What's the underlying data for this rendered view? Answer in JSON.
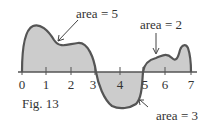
{
  "figure": {
    "caption": "Fig. 13",
    "x_ticks": [
      "0",
      "1",
      "2",
      "3",
      "4",
      "5",
      "6",
      "7"
    ],
    "annotations": [
      {
        "text": "area = 5",
        "region": "0 to 3, above axis"
      },
      {
        "text": "area = 2",
        "region": "5 to 7, above axis"
      },
      {
        "text": "area = 3",
        "region": "3 to 5, below axis"
      }
    ],
    "colors": {
      "curve": "#555555",
      "fill": "#cccccc",
      "axis": "#555555",
      "text": "#333333"
    }
  }
}
